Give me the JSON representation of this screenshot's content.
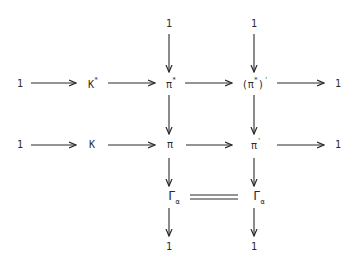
{
  "diagram": {
    "type": "commutative-diagram",
    "nodes": {
      "top_1_a": "1",
      "top_1_b": "1",
      "row1_left_1": "1",
      "row1_K_star": "K",
      "row1_K_star_sup": "*",
      "row1_pi_star": "π",
      "row1_pi_star_sup": "*",
      "row1_pi_star_prime_open": "(π",
      "row1_pi_star_prime_sup": "*",
      "row1_pi_star_prime_close": ")",
      "row1_pi_star_prime_prime": "'",
      "row1_right_1": "1",
      "row2_left_1": "1",
      "row2_K": "K",
      "row2_pi": "π",
      "row2_pi_prime": "π",
      "row2_pi_prime_sup": "'",
      "row2_right_1": "1",
      "row3_gamma_a": "Γ",
      "row3_gamma_a_sub": "α",
      "row3_gamma_b": "Γ",
      "row3_gamma_b_sub": "α",
      "bottom_1_a": "1",
      "bottom_1_b": "1"
    },
    "edges": [
      {
        "from": "1",
        "to": "K*",
        "kind": "arrow"
      },
      {
        "from": "K*",
        "to": "π*",
        "kind": "arrow"
      },
      {
        "from": "π*",
        "to": "(π*)'",
        "kind": "arrow"
      },
      {
        "from": "(π*)'",
        "to": "1",
        "kind": "arrow"
      },
      {
        "from": "1",
        "to": "K",
        "kind": "arrow"
      },
      {
        "from": "K",
        "to": "π",
        "kind": "arrow"
      },
      {
        "from": "π",
        "to": "π'",
        "kind": "arrow"
      },
      {
        "from": "π'",
        "to": "1",
        "kind": "arrow"
      },
      {
        "from": "1",
        "to": "π*",
        "kind": "arrow"
      },
      {
        "from": "π*",
        "to": "π",
        "kind": "arrow"
      },
      {
        "from": "π",
        "to": "Γα",
        "kind": "arrow"
      },
      {
        "from": "Γα",
        "to": "1",
        "kind": "arrow"
      },
      {
        "from": "1",
        "to": "(π*)'",
        "kind": "arrow"
      },
      {
        "from": "(π*)'",
        "to": "π'",
        "kind": "arrow"
      },
      {
        "from": "π'",
        "to": "Γα",
        "kind": "arrow"
      },
      {
        "from": "Γα",
        "to": "1",
        "kind": "arrow"
      },
      {
        "from": "Γα",
        "to": "Γα",
        "kind": "equality"
      }
    ],
    "colors": {
      "ink": "#2a2a2a",
      "background": "#ffffff"
    }
  }
}
